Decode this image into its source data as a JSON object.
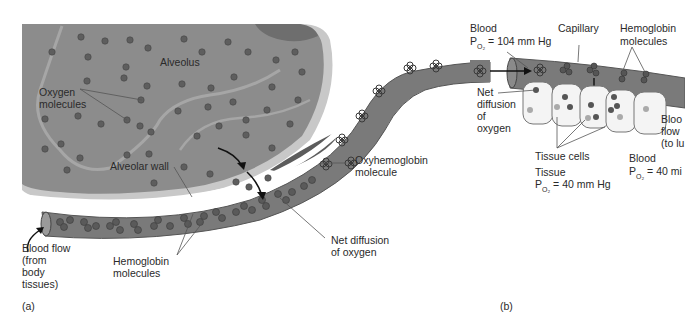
{
  "panel_a": {
    "panel_label": "(a)",
    "labels": {
      "alveolus": "Alveolus",
      "oxygen_molecules": [
        "Oxygen",
        "molecules"
      ],
      "alveolar_wall": "Alveolar wall",
      "oxyhemoglobin": [
        "Oxyhemoglobin",
        "molecule"
      ],
      "blood_flow": [
        "Blood flow",
        "(from",
        "body",
        "tissues)"
      ],
      "hemoglobin": [
        "Hemoglobin",
        "molecules"
      ],
      "net_diffusion": [
        "Net diffusion",
        "of oxygen"
      ]
    }
  },
  "panel_b": {
    "panel_label": "(b)",
    "labels": {
      "blood_top": "Blood",
      "blood_top_po2_prefix": "P",
      "blood_top_po2_sub": "O₂",
      "blood_top_po2_value": "= 104 mm Hg",
      "capillary": "Capillary",
      "hemoglobin": [
        "Hemoglobin",
        "molecules"
      ],
      "net_diffusion": [
        "Net",
        "diffusion",
        "of",
        "oxygen"
      ],
      "tissue_cells": "Tissue cells",
      "tissue": "Tissue",
      "tissue_po2_prefix": "P",
      "tissue_po2_sub": "O₂",
      "tissue_po2_value": "= 40 mm Hg",
      "blood_flow": [
        "Bloo",
        "flow",
        "(to lu"
      ],
      "blood_bottom": "Blood",
      "blood_bottom_po2_prefix": "P",
      "blood_bottom_po2_sub": "O₂",
      "blood_bottom_po2_value": "= 40 mi"
    }
  },
  "colors": {
    "alveolus_fill": "#8a8a8a",
    "alveolus_rim": "#b8b8b8",
    "vessel_fill": "#7c7c7c",
    "molecule": "#5a5a5a",
    "tissue_cell": "#f2f2f2",
    "text": "#2a2a2a"
  }
}
